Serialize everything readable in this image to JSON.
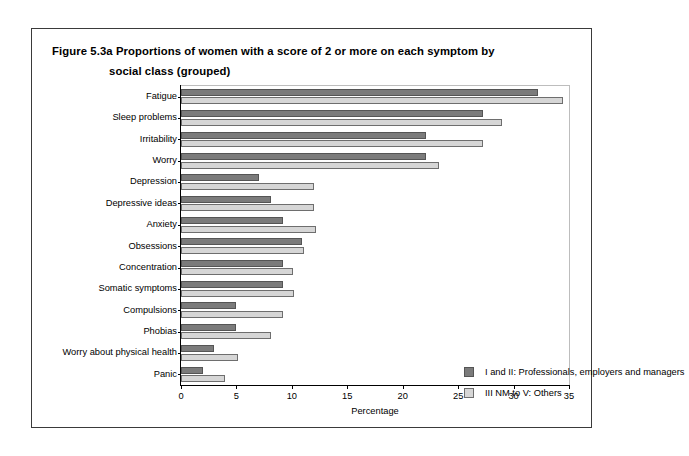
{
  "figure": {
    "title_line1": "Figure 5.3a  Proportions of women with a score of 2 or more on each symptom by",
    "title_line2": "social class (grouped)"
  },
  "chart_data": {
    "type": "bar",
    "orientation": "horizontal",
    "title": "Figure 5.3a  Proportions of women with a score of 2 or more on each symptom by social class (grouped)",
    "xlabel": "Percentage",
    "ylabel": "",
    "xlim": [
      0,
      35
    ],
    "xticks": [
      0,
      5,
      10,
      15,
      20,
      25,
      30,
      35
    ],
    "grid": false,
    "legend_position": "center-right inside plot",
    "categories": [
      "Fatigue",
      "Sleep problems",
      "Irritability",
      "Worry",
      "Depression",
      "Depressive ideas",
      "Anxiety",
      "Obsessions",
      "Concentration",
      "Somatic symptoms",
      "Compulsions",
      "Phobias",
      "Worry about physical health",
      "Panic"
    ],
    "series": [
      {
        "name": "I and II: Professionals, employers and managers",
        "color": "#7b7b7b",
        "values": [
          32.2,
          27.2,
          22.1,
          22.1,
          7.0,
          8.1,
          9.2,
          10.9,
          9.2,
          9.2,
          5.0,
          5.0,
          3.0,
          2.0
        ]
      },
      {
        "name": "III NM to V: Others",
        "color": "#d6d6d6",
        "values": [
          34.5,
          29.0,
          27.2,
          23.3,
          12.0,
          12.0,
          12.2,
          11.1,
          10.1,
          10.2,
          9.2,
          8.1,
          5.1,
          4.0
        ]
      }
    ]
  },
  "legend": {
    "items": [
      {
        "label": "I and II: Professionals, employers and managers",
        "swatch": "dark"
      },
      {
        "label": "III NM to V: Others",
        "swatch": "light"
      }
    ]
  }
}
